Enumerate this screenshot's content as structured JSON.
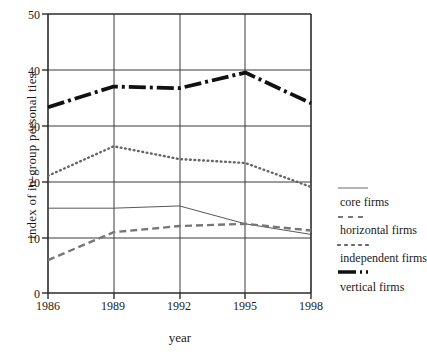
{
  "chart_data": {
    "type": "line",
    "title": "",
    "xlabel": "year",
    "ylabel": "index of in-group personal ties",
    "x": [
      1986,
      1989,
      1992,
      1995,
      1998
    ],
    "xtick_labels": [
      "1986",
      "1989",
      "1992",
      "1995",
      "1998"
    ],
    "ytick_labels": [
      "0",
      "10",
      "20",
      "30",
      "40",
      "50"
    ],
    "yticks": [
      0,
      10,
      20,
      30,
      40,
      50
    ],
    "xlim": [
      1986,
      1998
    ],
    "ylim": [
      0,
      50
    ],
    "grid": true,
    "legend_position": "right",
    "series": [
      {
        "name": "core firms",
        "style": "thin-solid",
        "values": [
          15.2,
          15.2,
          15.6,
          12.4,
          10.5
        ]
      },
      {
        "name": "horizontal firms",
        "style": "dashed",
        "values": [
          5.9,
          10.9,
          12.0,
          12.4,
          11.2
        ]
      },
      {
        "name": "independent firms",
        "style": "dotted",
        "values": [
          21.0,
          26.3,
          24.0,
          23.3,
          19.0
        ]
      },
      {
        "name": "vertical firms",
        "style": "thick-dash-dot",
        "values": [
          33.3,
          37.0,
          36.7,
          39.5,
          34.0
        ]
      }
    ]
  },
  "axes": {
    "ylabel": "index of in-group personal ties",
    "xlabel": "year",
    "ytick_labels": [
      "50",
      "40",
      "30",
      "20",
      "10",
      "0"
    ],
    "xtick_labels": [
      "1986",
      "1989",
      "1992",
      "1995",
      "1998"
    ]
  },
  "legend": {
    "entries": [
      {
        "label": "core firms",
        "style": "thin-solid"
      },
      {
        "label": "horizontal firms",
        "style": "dashed"
      },
      {
        "label": "independent firms",
        "style": "dotted"
      },
      {
        "label": "vertical firms",
        "style": "thick-dash-dot"
      }
    ]
  },
  "colors": {
    "background": "#ffffff",
    "ink": "#1a1a1a",
    "axis": "#2b2b2b",
    "grid": "#3a3a3a",
    "faint": "#8a8a8a"
  }
}
